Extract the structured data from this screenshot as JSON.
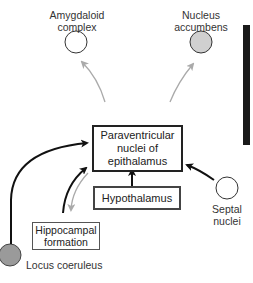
{
  "nodes": {
    "amygdaloid": {
      "label_line1": "Amygdaloid",
      "label_line2": "complex",
      "fill": "#ffffff"
    },
    "accumbens": {
      "label_line1": "Nucleus",
      "label_line2": "accumbens",
      "fill": "#d0d0d0"
    },
    "paraventricular": {
      "line1": "Paraventricular",
      "line2": "nuclei of",
      "line3": "epithalamus"
    },
    "hypothalamus": {
      "label": "Hypothalamus"
    },
    "hippocampal": {
      "line1": "Hippocampal",
      "line2": "formation"
    },
    "septal": {
      "label_line1": "Septal",
      "label_line2": "nuclei",
      "fill": "#ffffff"
    },
    "locus": {
      "label": "Locus coeruleus",
      "fill": "#9a9a9a"
    }
  },
  "colors": {
    "input_arrow": "#111111",
    "output_arrow": "#aaaaaa"
  }
}
